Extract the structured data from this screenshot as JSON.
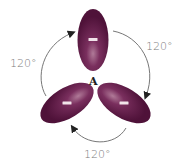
{
  "diagram": {
    "type": "trigonal-planar-electron-pairs",
    "central_atom": {
      "label": "A"
    },
    "lobes": [
      {
        "id": "top",
        "charge_symbol": "−",
        "angle_deg": 0
      },
      {
        "id": "bottom-left",
        "charge_symbol": "−",
        "angle_deg": -120
      },
      {
        "id": "bottom-right",
        "charge_symbol": "−",
        "angle_deg": 120
      }
    ],
    "angles": [
      {
        "position": "left",
        "label": "120°"
      },
      {
        "position": "right",
        "label": "120°"
      },
      {
        "position": "bottom",
        "label": "120°"
      }
    ],
    "colors": {
      "lobe": "#5a1a44",
      "lobe_highlight": "#b07a98",
      "arrow": "#555555",
      "label": "#7a7a7a"
    }
  }
}
